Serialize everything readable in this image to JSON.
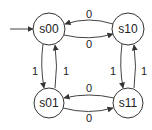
{
  "diagram": {
    "type": "state-machine",
    "initial_state": "s00",
    "states": [
      {
        "id": "s00",
        "label": "s00",
        "cx": 49,
        "cy": 29,
        "r": 16
      },
      {
        "id": "s10",
        "label": "s10",
        "cx": 128,
        "cy": 29,
        "r": 16
      },
      {
        "id": "s01",
        "label": "s01",
        "cx": 49,
        "cy": 103,
        "r": 15
      },
      {
        "id": "s11",
        "label": "s11",
        "cx": 128,
        "cy": 103,
        "r": 15
      }
    ],
    "transitions": [
      {
        "from": "s10",
        "to": "s00",
        "label": "0"
      },
      {
        "from": "s00",
        "to": "s10",
        "label": "0"
      },
      {
        "from": "s00",
        "to": "s01",
        "label": "1"
      },
      {
        "from": "s01",
        "to": "s00",
        "label": "1"
      },
      {
        "from": "s10",
        "to": "s11",
        "label": "1"
      },
      {
        "from": "s11",
        "to": "s10",
        "label": "1"
      },
      {
        "from": "s11",
        "to": "s01",
        "label": "0"
      },
      {
        "from": "s01",
        "to": "s11",
        "label": "0"
      }
    ],
    "colors": {
      "background": "#ffffff",
      "stroke": "#333333",
      "edge": "#444444",
      "text": "#222222"
    }
  }
}
